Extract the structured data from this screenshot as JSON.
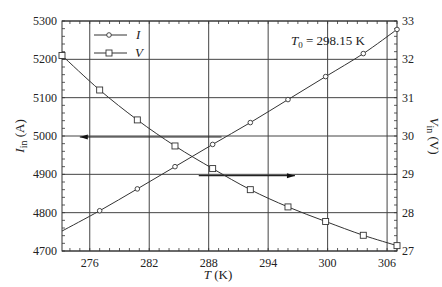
{
  "chart_data": {
    "type": "line",
    "title": "",
    "annotation": "T0 = 298.15 K",
    "annotation_parts": {
      "symbol": "T",
      "subscript": "0",
      "rest": " = 298.15 K"
    },
    "xlabel": "T (K)",
    "xlabel_parts": {
      "symbol": "T",
      "unit": " (K)"
    },
    "ylabel_left": "I_in (A)",
    "ylabel_left_parts": {
      "symbol": "I",
      "subscript": "in",
      "unit": " (A)"
    },
    "ylabel_right": "V_in (V)",
    "ylabel_right_parts": {
      "symbol": "V",
      "subscript": "in",
      "unit": " (V)"
    },
    "xlim": [
      273.2,
      307.0
    ],
    "ylim_left": [
      4700,
      5300
    ],
    "ylim_right": [
      27,
      33
    ],
    "x_ticks": [
      276,
      282,
      288,
      294,
      300,
      306
    ],
    "y_ticks_left": [
      4700,
      4800,
      4900,
      5000,
      5100,
      5200,
      5300
    ],
    "y_ticks_right": [
      27,
      28,
      29,
      30,
      31,
      32,
      33
    ],
    "grid": true,
    "legend_position": "upper left",
    "series": [
      {
        "name": "I",
        "axis": "left",
        "marker": "circle",
        "x": [
          273.2,
          277.0,
          280.8,
          284.6,
          288.4,
          292.2,
          296.0,
          299.8,
          303.6,
          307.0
        ],
        "values": [
          4752,
          4805,
          4862,
          4920,
          4978,
          5035,
          5095,
          5155,
          5215,
          5278
        ],
        "marker_indices": [
          1,
          2,
          3,
          4,
          5,
          6,
          7,
          8,
          9
        ]
      },
      {
        "name": "V",
        "axis": "right",
        "marker": "square",
        "x": [
          273.2,
          277.0,
          280.8,
          284.6,
          288.4,
          292.2,
          296.0,
          299.8,
          303.6,
          307.0
        ],
        "values": [
          32.1,
          31.2,
          30.42,
          29.74,
          29.15,
          28.6,
          28.15,
          27.77,
          27.41,
          27.14
        ],
        "marker_indices": [
          0,
          1,
          2,
          3,
          4,
          5,
          6,
          7,
          8,
          9
        ]
      }
    ],
    "arrows": [
      {
        "name": "arrow-to-left-axis",
        "y_left": 5000,
        "x_from": 289.3,
        "x_to": 275.0,
        "direction": "left"
      },
      {
        "name": "arrow-to-right-axis",
        "y_left": 4899,
        "x_from": 287.0,
        "x_to": 296.7,
        "direction": "right"
      }
    ]
  },
  "layout": {
    "plot": {
      "left": 62,
      "right": 397,
      "top": 21,
      "bottom": 251
    },
    "colors": {
      "line": "#333333",
      "grid": "#444444",
      "axis": "#333333",
      "text": "#222222",
      "bg": "#ffffff"
    }
  }
}
